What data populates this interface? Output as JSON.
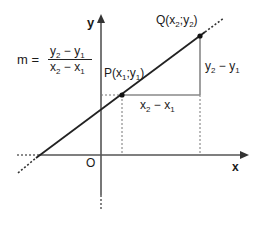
{
  "diagram": {
    "axes": {
      "x_label": "x",
      "y_label": "y",
      "origin_label": "O"
    },
    "points": [
      {
        "id": "P",
        "label_main": "P(x",
        "sub1": "1",
        "sep": ";y",
        "sub2": "1",
        "close": ")",
        "px": [
          122,
          95
        ]
      },
      {
        "id": "Q",
        "label_main": "Q(x",
        "sub1": "2",
        "sep": ";y",
        "sub2": "2",
        "close": ")",
        "px": [
          200,
          36
        ]
      }
    ],
    "formula": {
      "lhs": "m =",
      "numerator": {
        "a": "y",
        "a_sub": "2",
        "op": " − ",
        "b": "y",
        "b_sub": "1"
      },
      "denominator": {
        "a": "x",
        "a_sub": "2",
        "op": " − ",
        "b": "x",
        "b_sub": "1"
      }
    },
    "rise_label": {
      "a": "y",
      "a_sub": "2",
      "op": " − ",
      "b": "y",
      "b_sub": "1"
    },
    "run_label": {
      "a": "x",
      "a_sub": "2",
      "op": " − ",
      "b": "x",
      "b_sub": "1"
    },
    "colors": {
      "line": "#222222",
      "axis": "#555555",
      "triangle": "#888888",
      "dotted": "#777777",
      "text": "#1a1a1a"
    }
  }
}
